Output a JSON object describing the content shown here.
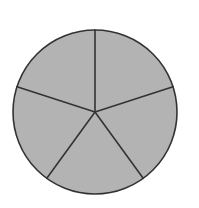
{
  "diagram": {
    "type": "circle-divided-into-equal-sectors",
    "sector_count": 5,
    "center": [
      95,
      112
    ],
    "radius": 82,
    "start_angle_deg": -90,
    "fill_color": "#b3b3b3",
    "stroke_color": "#333333",
    "stroke_width": 1.6,
    "background": "#ffffff"
  }
}
